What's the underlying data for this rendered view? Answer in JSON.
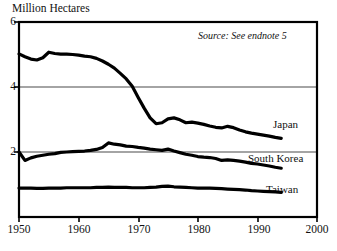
{
  "axis_title": "Million Hectares",
  "source_note": "Source: See endnote 5",
  "labels": {
    "japan": "Japan",
    "south_korea": "South Korea",
    "taiwan": "Taiwan"
  },
  "ytick_labels": [
    "6",
    "4",
    "2"
  ],
  "xtick_labels": [
    "1950",
    "1960",
    "1970",
    "1980",
    "1990",
    "2000"
  ],
  "colors": {
    "line": "#000000",
    "grid": "#4a4a4a",
    "frame": "#000000",
    "background": "#ffffff",
    "text": "#111111"
  },
  "chart_data": {
    "type": "line",
    "title": "",
    "subtitle": "",
    "xlabel": "",
    "ylabel": "Million Hectares",
    "xlim": [
      1950,
      2000
    ],
    "ylim": [
      0,
      6
    ],
    "xticks": [
      1950,
      1960,
      1970,
      1980,
      1990,
      2000
    ],
    "yticks": [
      0,
      2,
      4,
      6
    ],
    "grid": "horizontal gridlines at y = 2 and y = 4",
    "legend": "inline labels at right end of each series",
    "annotations": [
      "Source: See endnote 5"
    ],
    "x": [
      1950,
      1951,
      1952,
      1953,
      1954,
      1955,
      1956,
      1957,
      1958,
      1959,
      1960,
      1961,
      1962,
      1963,
      1964,
      1965,
      1966,
      1967,
      1968,
      1969,
      1970,
      1971,
      1972,
      1973,
      1974,
      1975,
      1976,
      1977,
      1978,
      1979,
      1980,
      1981,
      1982,
      1983,
      1984,
      1985,
      1986,
      1987,
      1988,
      1989,
      1990,
      1991,
      1992,
      1993,
      1994
    ],
    "series": [
      {
        "name": "Japan",
        "values": [
          5.02,
          4.93,
          4.86,
          4.83,
          4.9,
          5.07,
          5.03,
          5.01,
          5.01,
          5.0,
          4.98,
          4.95,
          4.93,
          4.88,
          4.8,
          4.7,
          4.58,
          4.42,
          4.25,
          4.02,
          3.68,
          3.35,
          3.05,
          2.87,
          2.9,
          3.02,
          3.05,
          2.99,
          2.9,
          2.92,
          2.89,
          2.85,
          2.8,
          2.76,
          2.74,
          2.79,
          2.75,
          2.68,
          2.62,
          2.58,
          2.55,
          2.52,
          2.49,
          2.45,
          2.42
        ]
      },
      {
        "name": "South Korea",
        "values": [
          2.0,
          1.74,
          1.82,
          1.87,
          1.9,
          1.93,
          1.95,
          1.99,
          2.0,
          2.01,
          2.02,
          2.03,
          2.05,
          2.08,
          2.14,
          2.28,
          2.24,
          2.22,
          2.18,
          2.17,
          2.14,
          2.12,
          2.09,
          2.07,
          2.05,
          2.09,
          2.03,
          1.98,
          1.93,
          1.9,
          1.86,
          1.84,
          1.83,
          1.8,
          1.74,
          1.76,
          1.74,
          1.72,
          1.69,
          1.65,
          1.63,
          1.6,
          1.57,
          1.53,
          1.5
        ]
      },
      {
        "name": "Taiwan",
        "values": [
          0.89,
          0.89,
          0.89,
          0.88,
          0.88,
          0.89,
          0.89,
          0.89,
          0.9,
          0.9,
          0.9,
          0.9,
          0.9,
          0.91,
          0.91,
          0.92,
          0.91,
          0.91,
          0.91,
          0.9,
          0.9,
          0.9,
          0.91,
          0.92,
          0.94,
          0.95,
          0.93,
          0.92,
          0.91,
          0.9,
          0.89,
          0.89,
          0.89,
          0.88,
          0.87,
          0.86,
          0.85,
          0.84,
          0.83,
          0.81,
          0.8,
          0.79,
          0.78,
          0.77,
          0.76
        ]
      }
    ]
  }
}
